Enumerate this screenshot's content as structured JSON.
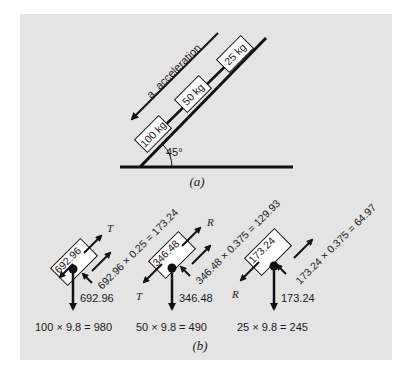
{
  "figure": {
    "part_a": {
      "caption": "(a)",
      "acceleration_label": "a, acceleration",
      "angle_label": "45°",
      "masses": [
        {
          "label": "100 kg"
        },
        {
          "label": "50 kg"
        },
        {
          "label": "25 kg"
        }
      ]
    },
    "part_b": {
      "caption": "(b)",
      "bodies": [
        {
          "box_label": "692.96",
          "normal_label": "692.96",
          "friction_label": "692.96 × 0.25 = 173.24",
          "tension_up_label": "T",
          "tension_down_label": "",
          "weight_label": "100 × 9.8 = 980"
        },
        {
          "box_label": "346.48",
          "normal_label": "346.48",
          "friction_label": "346.48 × 0.375 = 129.93",
          "tension_up_label": "R",
          "tension_down_label": "T",
          "weight_label": "50 × 9.8 = 490"
        },
        {
          "box_label": "173.24",
          "normal_label": "173.24",
          "friction_label": "173.24 × 0.375 = 64.97",
          "tension_up_label": "",
          "tension_down_label": "R",
          "weight_label": "25 × 9.8 = 245"
        }
      ]
    },
    "colors": {
      "background": "#e4e4e4",
      "ink": "#111111",
      "box_fill": "#ffffff"
    }
  }
}
